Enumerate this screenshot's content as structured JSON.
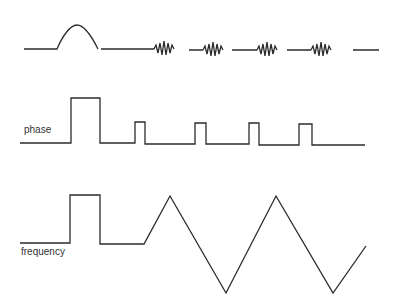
{
  "diagram": {
    "type": "signal-timing-diagram",
    "stroke_color": "#2b2b2b",
    "background": "#ffffff",
    "rows": [
      {
        "id": "amplitude",
        "label": "",
        "description": "Baseline with a half-sine pulse, then four oscillating wave packets separated by flat segments",
        "path": "M24,49 L57,49 C62,37 70,25 77,25 C85,25 92,37 98,49 M101,49 L154,49 M154,49 l2,-4 l2,8 l2,-10 l2,12 l2,-14 l2,14 l2,-12 l2,10 l2,-8 l2,4 M189,50 L203,50 M203,50 l2,-4 l2,8 l2,-10 l2,12 l2,-14 l2,14 l2,-12 l2,10 l2,-8 l2,4 M232,50 L257,50 M257,50 l2,-4 l2,8 l2,-10 l2,12 l2,-14 l2,14 l2,-12 l2,10 l2,-8 l2,4 M287,50 L311,50 M311,50 l2,-4 l2,8 l2,-10 l2,12 l2,-14 l2,14 l2,-12 l2,10 l2,-8 l2,4 M353,50 L379,50"
      },
      {
        "id": "phase",
        "label": "phase",
        "description": "Square pulses: one wide pulse then four narrow pulses",
        "path": "M20,143 L71,143 L71,98 L100,98 L100,143 L135,143 L135,122 L145,122 L145,144 L195,144 L195,123 L206,123 L206,144 L249,144 L249,123 L259,123 L259,145 L299,145 L299,124 L312,124 L312,145 L365,145"
      },
      {
        "id": "frequency",
        "label": "frequency",
        "description": "One wide square pulse, then a triangle (chirp) waveform",
        "path": "M20,243 L70,243 L70,195 L100,195 L100,244 L144,244 L170,196 L226,293 L276,196 L333,293 L366,246"
      }
    ]
  },
  "labels": {
    "phase": "phase",
    "frequency": "frequency"
  }
}
